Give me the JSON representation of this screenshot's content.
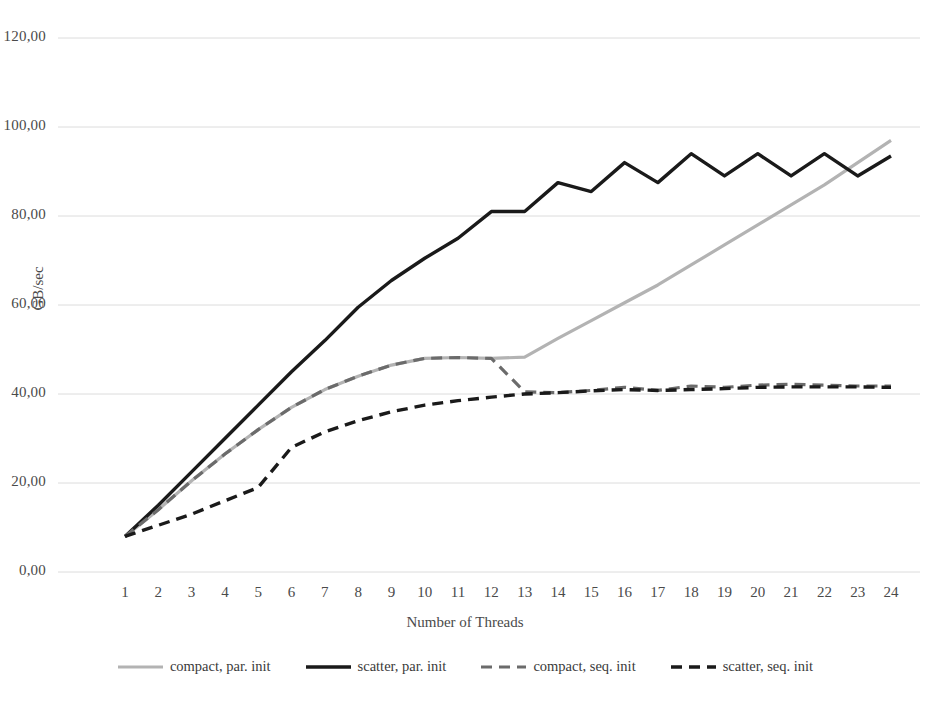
{
  "chart_data": {
    "type": "line",
    "title": "",
    "xlabel": "Number of Threads",
    "ylabel": "GB/sec",
    "x": [
      1,
      2,
      3,
      4,
      5,
      6,
      7,
      8,
      9,
      10,
      11,
      12,
      13,
      14,
      15,
      16,
      17,
      18,
      19,
      20,
      21,
      22,
      23,
      24
    ],
    "xlim": [
      1,
      24
    ],
    "ylim": [
      0,
      120
    ],
    "y_ticks": [
      0,
      20,
      40,
      60,
      80,
      100,
      120
    ],
    "y_tick_labels": [
      "0,00",
      "20,00",
      "40,00",
      "60,00",
      "80,00",
      "100,00",
      "120,00"
    ],
    "x_tick_labels": [
      "1",
      "2",
      "3",
      "4",
      "5",
      "6",
      "7",
      "8",
      "9",
      "10",
      "11",
      "12",
      "13",
      "14",
      "15",
      "16",
      "17",
      "18",
      "19",
      "20",
      "21",
      "22",
      "23",
      "24"
    ],
    "grid": "horizontal",
    "legend_position": "bottom",
    "series": [
      {
        "name": "compact, par. init",
        "color": "#b3b3b3",
        "style": "solid",
        "width": 3.2,
        "values": [
          8.0,
          14.0,
          20.5,
          26.5,
          32.0,
          37.0,
          41.0,
          44.0,
          46.5,
          48.0,
          48.2,
          48.0,
          48.3,
          52.5,
          56.5,
          60.5,
          64.5,
          69.0,
          73.5,
          78.0,
          82.5,
          87.0,
          92.0,
          97.0
        ]
      },
      {
        "name": "scatter, par. init",
        "color": "#1a1a1a",
        "style": "solid",
        "width": 3.4,
        "values": [
          8.0,
          15.0,
          22.5,
          30.0,
          37.5,
          45.0,
          52.0,
          59.5,
          65.5,
          70.5,
          75.0,
          81.0,
          81.0,
          87.5,
          85.5,
          92.0,
          87.5,
          94.0,
          89.0,
          94.0,
          89.0,
          94.0,
          89.0,
          93.5
        ]
      },
      {
        "name": "compact, seq. init",
        "color": "#6b6b6b",
        "style": "dashed",
        "width": 3.2,
        "values": [
          8.0,
          14.0,
          20.5,
          26.5,
          32.0,
          37.0,
          41.0,
          44.0,
          46.5,
          48.0,
          48.2,
          48.0,
          40.5,
          40.3,
          40.8,
          41.5,
          40.8,
          41.8,
          41.5,
          42.0,
          42.2,
          42.0,
          41.8,
          41.8
        ]
      },
      {
        "name": "scatter, seq. init",
        "color": "#1a1a1a",
        "style": "dashed",
        "width": 3.4,
        "values": [
          8.0,
          10.5,
          13.0,
          16.0,
          19.0,
          28.0,
          31.5,
          34.0,
          36.0,
          37.5,
          38.5,
          39.3,
          40.0,
          40.3,
          40.7,
          41.0,
          40.8,
          41.0,
          41.2,
          41.5,
          41.6,
          41.6,
          41.6,
          41.5
        ]
      }
    ]
  },
  "legend": {
    "items": [
      {
        "label": "compact, par. init"
      },
      {
        "label": "scatter, par. init"
      },
      {
        "label": "compact, seq. init"
      },
      {
        "label": "scatter, seq. init"
      }
    ]
  },
  "axes": {
    "y_title": "GB/sec",
    "x_title": "Number of Threads"
  },
  "colors": {
    "grid": "#dcdcdc",
    "text": "#4a4a4a",
    "light_series": "#b3b3b3",
    "mid_series": "#6b6b6b",
    "dark_series": "#1a1a1a",
    "background": "#ffffff"
  }
}
